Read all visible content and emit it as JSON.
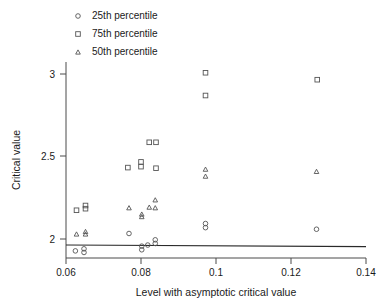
{
  "chart_data": {
    "type": "scatter",
    "title": "",
    "xlabel": "Level with asymptotic critical value",
    "ylabel": "Critical value",
    "xlim": [
      0.06,
      0.14
    ],
    "ylim": [
      1.88,
      3.12
    ],
    "xticks": [
      0.06,
      0.08,
      0.1,
      0.12,
      0.14
    ],
    "xtick_labels": [
      "0.06",
      "0.08",
      "0.1",
      "0.12",
      "0.14"
    ],
    "yticks": [
      2,
      2.5,
      3
    ],
    "ytick_labels": [
      "2",
      "2.5",
      "3"
    ],
    "grid": false,
    "legend_position": "top-left",
    "series": [
      {
        "name": "25th percentile",
        "marker": "circle",
        "points": [
          {
            "x": 0.0625,
            "y": 1.925
          },
          {
            "x": 0.0648,
            "y": 1.938
          },
          {
            "x": 0.0648,
            "y": 1.915
          },
          {
            "x": 0.0768,
            "y": 2.035
          },
          {
            "x": 0.0802,
            "y": 1.955
          },
          {
            "x": 0.0802,
            "y": 1.932
          },
          {
            "x": 0.0818,
            "y": 1.962
          },
          {
            "x": 0.0838,
            "y": 1.995
          },
          {
            "x": 0.0838,
            "y": 1.972
          },
          {
            "x": 0.0972,
            "y": 2.098
          },
          {
            "x": 0.0972,
            "y": 2.072
          },
          {
            "x": 0.1268,
            "y": 2.062
          }
        ]
      },
      {
        "name": "75th percentile",
        "marker": "square",
        "points": [
          {
            "x": 0.0628,
            "y": 2.182
          },
          {
            "x": 0.0652,
            "y": 2.212
          },
          {
            "x": 0.0652,
            "y": 2.192
          },
          {
            "x": 0.0765,
            "y": 2.452
          },
          {
            "x": 0.08,
            "y": 2.488
          },
          {
            "x": 0.08,
            "y": 2.458
          },
          {
            "x": 0.0822,
            "y": 2.612
          },
          {
            "x": 0.084,
            "y": 2.612
          },
          {
            "x": 0.084,
            "y": 2.448
          },
          {
            "x": 0.0972,
            "y": 3.052
          },
          {
            "x": 0.0972,
            "y": 2.908
          },
          {
            "x": 0.127,
            "y": 3.008
          }
        ]
      },
      {
        "name": "50th percentile",
        "marker": "triangle",
        "points": [
          {
            "x": 0.0628,
            "y": 2.032
          },
          {
            "x": 0.0652,
            "y": 2.048
          },
          {
            "x": 0.0652,
            "y": 2.032
          },
          {
            "x": 0.0768,
            "y": 2.198
          },
          {
            "x": 0.0802,
            "y": 2.158
          },
          {
            "x": 0.0802,
            "y": 2.142
          },
          {
            "x": 0.0822,
            "y": 2.202
          },
          {
            "x": 0.0838,
            "y": 2.248
          },
          {
            "x": 0.0838,
            "y": 2.198
          },
          {
            "x": 0.0972,
            "y": 2.442
          },
          {
            "x": 0.0972,
            "y": 2.398
          },
          {
            "x": 0.1268,
            "y": 2.428
          }
        ]
      }
    ],
    "reference_line": {
      "name": "asymptotic critical value",
      "x_start": 0.06,
      "y_start": 1.962,
      "x_end": 0.14,
      "y_end": 1.952
    }
  }
}
